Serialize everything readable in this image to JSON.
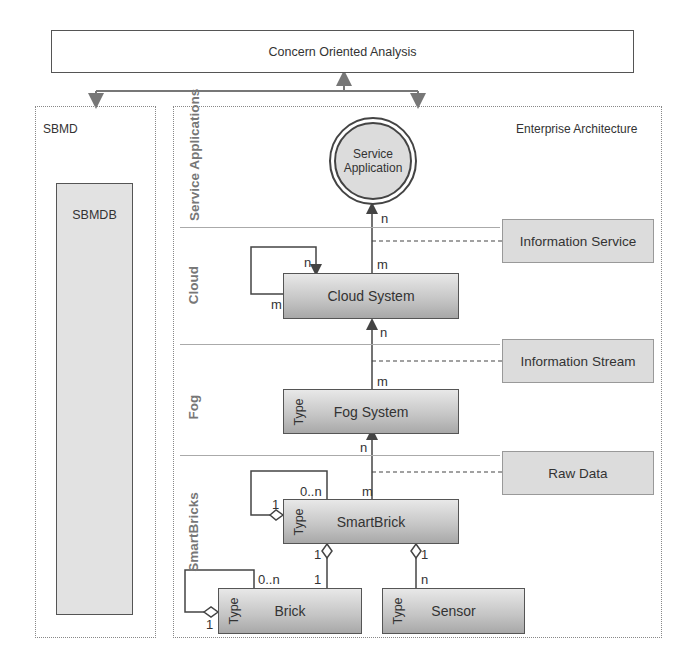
{
  "top": {
    "title": "Concern Oriented Analysis"
  },
  "sbmd": {
    "label": "SBMD",
    "db_label": "SBMDB"
  },
  "ea": {
    "label": "Enterprise Architecture",
    "lanes": [
      {
        "label": "Service Applications"
      },
      {
        "label": "Cloud"
      },
      {
        "label": "Fog"
      },
      {
        "label": "SmartBricks"
      }
    ],
    "service_application": "Service Application",
    "classes": {
      "cloud": {
        "name": "Cloud System"
      },
      "fog": {
        "name": "Fog System",
        "stereotype": "Type"
      },
      "smartbrick": {
        "name": "SmartBrick",
        "stereotype": "Type"
      },
      "brick": {
        "name": "Brick",
        "stereotype": "Type"
      },
      "sensor": {
        "name": "Sensor",
        "stereotype": "Type"
      }
    },
    "info_boxes": [
      {
        "label": "Information Service"
      },
      {
        "label": "Information Stream"
      },
      {
        "label": "Raw Data"
      }
    ],
    "multiplicities": {
      "sa_n": "n",
      "cloud_top_m": "m",
      "cloud_self_n": "n",
      "cloud_self_m": "m",
      "cloud_bottom_n": "n",
      "fog_top_m": "m",
      "fog_bottom_n": "n",
      "sb_top_m": "m",
      "sb_self_0n": "0..n",
      "sb_self_1": "1",
      "sb_brick_1a": "1",
      "sb_brick_1b": "1",
      "sb_sensor_1": "1",
      "sb_sensor_n": "n",
      "brick_self_0n": "0..n",
      "brick_self_1": "1"
    }
  }
}
